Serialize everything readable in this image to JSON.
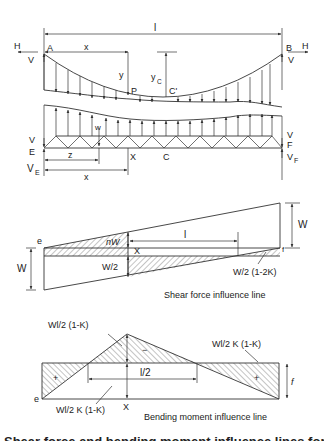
{
  "figure": {
    "top_diagram": {
      "span_label": "l",
      "left_support": "A",
      "right_support": "B",
      "horizontal_force_left": "H",
      "horizontal_force_right": "H",
      "vertical_force_left": "V",
      "vertical_force_right": "V",
      "distance_x": "x",
      "ordinate_y": "y",
      "ordinate_yc_main": "y",
      "ordinate_yc_sub": "C",
      "point_p": "P",
      "point_c_prime": "C'",
      "hanger_load": "w",
      "truss_left_reaction_top": "V",
      "truss_left_reaction_top_sub": "E",
      "truss_left_reaction_bottom": "V",
      "truss_left_reaction_bottom_sub": "E",
      "truss_right_reaction_top": "V",
      "truss_right_reaction_top_sub": "F",
      "truss_right_reaction_bottom": "V",
      "truss_right_reaction_bottom_sub": "F",
      "section_x": "X",
      "section_c": "C",
      "distance_z": "z",
      "distance_x_lower": "x"
    },
    "shear_diagram": {
      "end_e": "e",
      "end_f": "f",
      "dim_w_left": "W",
      "dim_w_right": "W",
      "label_nw": "nW",
      "label_x": "X",
      "label_l": "l",
      "label_w2": "W/2",
      "label_w2_1_2k": "W/2 (1-2K)",
      "caption": "Shear force influence line"
    },
    "bending_diagram": {
      "label_top_left": "Wl/2 (1-K)",
      "label_top_right": "Wl/2 K (1-K)",
      "label_bottom": "Wl/2 K (1-K)",
      "label_half_l": "l/2",
      "sign_plus_left": "+",
      "sign_minus_center": "−",
      "sign_plus_right": "+",
      "label_f": "f",
      "end_e": "e",
      "label_x": "X",
      "caption": "Bending moment influence line"
    },
    "caption_partial": "Figure: forces and bending moments influence lines (cut off)"
  }
}
